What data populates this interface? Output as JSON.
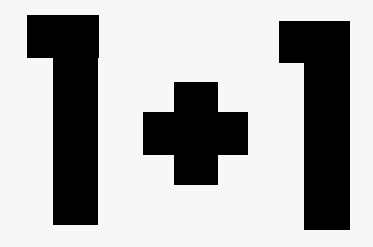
{
  "graphic": {
    "expression": "1+1",
    "glyphs": [
      {
        "char": "1",
        "name": "digit-one-left"
      },
      {
        "char": "+",
        "name": "plus-sign"
      },
      {
        "char": "1",
        "name": "digit-one-right"
      }
    ],
    "colors": {
      "background": "#f7f7f7",
      "foreground": "#000000"
    }
  }
}
